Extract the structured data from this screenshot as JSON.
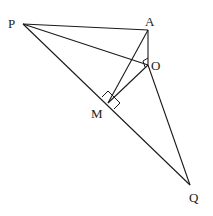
{
  "diagram": {
    "type": "geometry",
    "points": {
      "P": {
        "label": "P",
        "x": 23,
        "y": 24
      },
      "A": {
        "label": "A",
        "x": 148,
        "y": 30
      },
      "O": {
        "label": "O",
        "x": 148,
        "y": 65
      },
      "M": {
        "label": "M",
        "x": 108,
        "y": 103
      },
      "Q": {
        "label": "Q",
        "x": 190,
        "y": 185
      }
    },
    "segments": [
      "PA",
      "PO",
      "PQ",
      "AO",
      "OQ",
      "AM",
      "OM"
    ],
    "right_angles": [
      "PMO",
      "QMO",
      "AOM"
    ],
    "labels": {
      "P": "P",
      "A": "A",
      "O": "O",
      "M": "M",
      "Q": "Q"
    }
  }
}
